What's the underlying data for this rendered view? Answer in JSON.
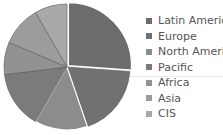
{
  "chart_data": {
    "type": "pie",
    "title": "",
    "categories": [
      "Latin America",
      "Europe",
      "North America",
      "Pacific",
      "Africa",
      "Asia",
      "CIS"
    ],
    "values": [
      26.1,
      18.6,
      13.6,
      14.7,
      8.3,
      10.3,
      8.3
    ],
    "colors": [
      "#6c6c6c",
      "#717171",
      "#8c8c8c",
      "#7b7b7b",
      "#929292",
      "#9c9c9c",
      "#a9a9a9"
    ],
    "start_angle_deg": 0,
    "direction": "clockwise",
    "exploded": [
      "Latin America"
    ],
    "legend_position": "right"
  },
  "legend": {
    "items": [
      {
        "label": "Latin America",
        "color": "#6c6c6c"
      },
      {
        "label": "Europe",
        "color": "#717171"
      },
      {
        "label": "North America",
        "color": "#8c8c8c"
      },
      {
        "label": "Pacific",
        "color": "#7b7b7b"
      },
      {
        "label": "Africa",
        "color": "#929292"
      },
      {
        "label": "Asia",
        "color": "#9c9c9c"
      },
      {
        "label": "CIS",
        "color": "#a9a9a9"
      }
    ]
  }
}
